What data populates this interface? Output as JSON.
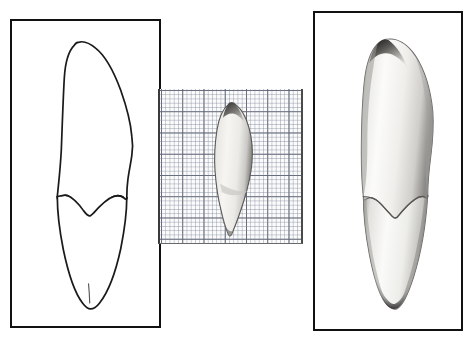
{
  "figure": {
    "background_color": "#ffffff",
    "width": 472,
    "height": 340
  },
  "panels": [
    {
      "id": "drawing-panel",
      "label": "Line drawing of tooth, labial view",
      "frame_color": "#111111",
      "frame_width_px": 2.5,
      "background_color": "#ffffff",
      "content_type": "line-drawing",
      "outline_color": "#1a1a1a",
      "features": [
        "crown apex",
        "mesial crown margin",
        "distal crown margin",
        "cervical line (V shaped)",
        "root body",
        "root apex",
        "median root groove"
      ]
    },
    {
      "id": "scale-photo-panel",
      "label": "Photograph of tooth on millimetre graph paper",
      "background_color": "#fbfbfb",
      "content_type": "photograph-with-scale-grid",
      "grid": {
        "minor_cell_px": 4.25,
        "major_cell_px": 21.25,
        "minor_line_color": "#7882 96",
        "major_line_color": "#3c4150",
        "minor_per_major": 5
      },
      "specimen_color_light": "#f2f1ee",
      "specimen_color_dark": "#4b4a48"
    },
    {
      "id": "photo-panel",
      "label": "Shaded photograph of tooth, labial view",
      "frame_color": "#111111",
      "frame_width_px": 2.5,
      "background_color": "#ffffff",
      "content_type": "photograph",
      "specimen_color_light": "#fbfbfa",
      "specimen_color_mid": "#d2d1cf",
      "specimen_color_dark": "#2e2d2c",
      "features": [
        "crown apex",
        "enamel shoulder",
        "cervical line (V shaped)",
        "root body",
        "root apex"
      ]
    }
  ],
  "colors": {
    "page_background": "#ffffff",
    "ink": "#111111",
    "outline": "#1a1a1a",
    "grid_minor": "#788296",
    "grid_major": "#3c4150",
    "specimen_highlight": "#fdfdfc",
    "specimen_shadow": "#3a3938"
  },
  "annotations": {
    "title": "",
    "caption": "",
    "scale_note": ""
  }
}
